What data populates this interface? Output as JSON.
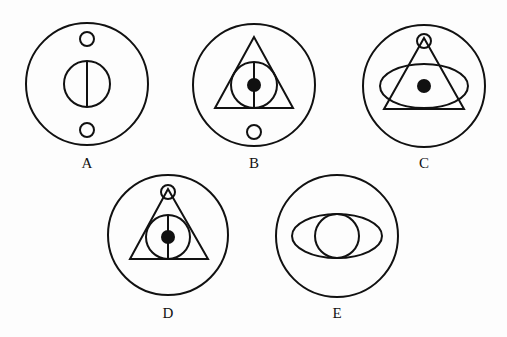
{
  "figures": [
    {
      "label": "A",
      "cx": 87,
      "cy": 84,
      "r": 61,
      "label_y": 168,
      "elements": [
        "outer-circle",
        "small-circle-top",
        "inner-circle-with-vertical-line",
        "small-circle-bottom"
      ]
    },
    {
      "label": "B",
      "cx": 254,
      "cy": 85,
      "r": 61,
      "label_y": 168,
      "elements": [
        "outer-circle",
        "triangle",
        "inner-circle-with-vertical-line",
        "filled-dot",
        "small-circle-bottom"
      ]
    },
    {
      "label": "C",
      "cx": 424,
      "cy": 86,
      "r": 61,
      "label_y": 168,
      "elements": [
        "outer-circle",
        "small-circle-top",
        "triangle",
        "ellipse",
        "filled-dot"
      ]
    },
    {
      "label": "D",
      "cx": 168,
      "cy": 235,
      "r": 60,
      "label_y": 318,
      "elements": [
        "outer-circle",
        "small-circle-top",
        "triangle",
        "inner-circle-with-vertical-line",
        "filled-dot"
      ]
    },
    {
      "label": "E",
      "cx": 337,
      "cy": 236,
      "r": 61,
      "label_y": 318,
      "elements": [
        "outer-circle",
        "ellipse",
        "inner-circle"
      ]
    }
  ],
  "colors": {
    "stroke": "#111111",
    "background": "#fdfdfd"
  }
}
